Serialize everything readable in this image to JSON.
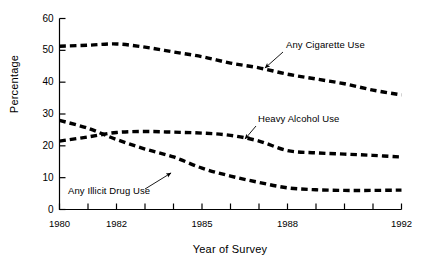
{
  "chart_data": {
    "type": "line",
    "title": "",
    "xlabel": "Year of Survey",
    "ylabel": "Percentage",
    "xlim": [
      1980,
      1992
    ],
    "ylim": [
      0,
      60
    ],
    "grid": false,
    "legend_position": "inline-annotations",
    "x": [
      1980,
      1981,
      1982,
      1983,
      1984,
      1985,
      1986,
      1987,
      1988,
      1989,
      1990,
      1991,
      1992
    ],
    "y_ticks": [
      0,
      10,
      20,
      30,
      40,
      50,
      60
    ],
    "y_tick_labels": [
      "0",
      "10",
      "20",
      "30",
      "40",
      "50",
      "60"
    ],
    "x_ticks": [
      1980,
      1981,
      1982,
      1983,
      1984,
      1985,
      1986,
      1987,
      1988,
      1989,
      1990,
      1991,
      1992
    ],
    "x_tick_labels": [
      "1980",
      "",
      "1982",
      "",
      "",
      "1985",
      "",
      "",
      "1988",
      "",
      "",
      "",
      "1992"
    ],
    "series": [
      {
        "name": "Any Cigarette Use",
        "values": [
          51.3,
          51.6,
          52.0,
          51.0,
          49.5,
          48.0,
          46.0,
          44.5,
          42.5,
          41.0,
          39.5,
          37.5,
          36.0
        ],
        "annotation": {
          "label": "Any Cigarette Use",
          "label_x": 286,
          "label_y": 39,
          "arrow_from_x": 283,
          "arrow_from_y": 52,
          "arrow_to_x": 265,
          "arrow_to_y": 68
        }
      },
      {
        "name": "Heavy Alcohol Use",
        "values": [
          21.5,
          22.8,
          24.2,
          24.5,
          24.3,
          24.0,
          23.3,
          21.5,
          18.5,
          17.8,
          17.4,
          17.0,
          16.5
        ],
        "annotation": {
          "label": "Heavy Alcohol Use",
          "label_x": 258,
          "label_y": 113,
          "arrow_from_x": 256,
          "arrow_from_y": 126,
          "arrow_to_x": 245,
          "arrow_to_y": 139
        }
      },
      {
        "name": "Any Illicit Drug Use",
        "values": [
          28.0,
          25.5,
          22.0,
          19.0,
          16.5,
          13.0,
          10.5,
          8.5,
          6.8,
          6.2,
          6.0,
          6.0,
          6.1
        ],
        "annotation": {
          "label": "Any Illicit Drug Use",
          "label_x": 68,
          "label_y": 185,
          "arrow_from_x": 145,
          "arrow_from_y": 189,
          "arrow_to_x": 171,
          "arrow_to_y": 173
        }
      }
    ],
    "colors": {
      "line": "#000000",
      "axis": "#000000",
      "background": "#ffffff"
    },
    "line_style": "dashed"
  }
}
